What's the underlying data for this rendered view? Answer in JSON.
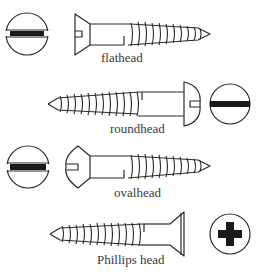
{
  "diagram": {
    "type": "screw head types illustration",
    "stroke_color": "#2a2a2a",
    "background": "#ffffff",
    "screws": [
      {
        "id": "flathead",
        "label": "flathead",
        "head_view": "slotted",
        "orientation": "head-left"
      },
      {
        "id": "roundhead",
        "label": "roundhead",
        "head_view": "slotted",
        "orientation": "head-right"
      },
      {
        "id": "ovalhead",
        "label": "ovalhead",
        "head_view": "slotted",
        "orientation": "head-left"
      },
      {
        "id": "phillips",
        "label": "Phillips head",
        "head_view": "cross",
        "orientation": "head-right"
      }
    ]
  }
}
